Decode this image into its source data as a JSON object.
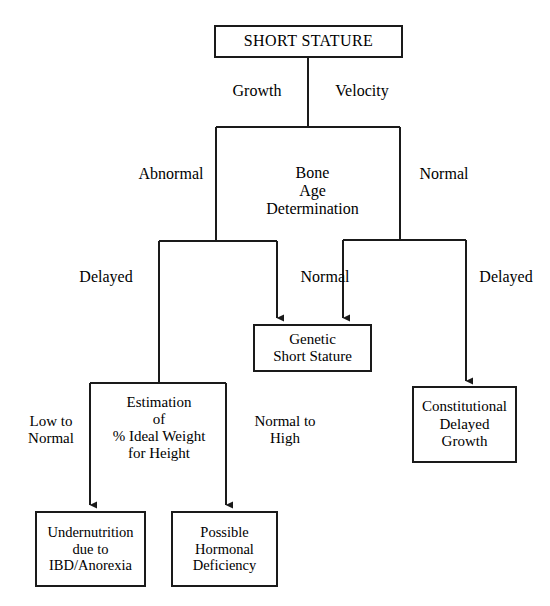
{
  "diagram": {
    "stroke_color": "#1a1a1a",
    "background_color": "#ffffff",
    "text_color": "#000000"
  },
  "nodes": {
    "short_stature": "SHORT STATURE",
    "genetic_short_stature": "Genetic\nShort Stature",
    "constitutional_delayed_growth": "Constitutional\nDelayed\nGrowth",
    "undernutrition": "Undernutrition\ndue to\nIBD/Anorexia",
    "possible_hormonal_deficiency": "Possible\nHormonal\nDeficiency"
  },
  "labels": {
    "growth": "Growth",
    "velocity": "Velocity",
    "bone_age_determination": "Bone\nAge\nDetermination",
    "abnormal": "Abnormal",
    "normal_right": "Normal",
    "delayed_left": "Delayed",
    "normal_mid": "Normal",
    "delayed_right": "Delayed",
    "estimation": "Estimation\nof\n% Ideal Weight\nfor Height",
    "low_to_normal": "Low to\nNormal",
    "normal_to_high": "Normal to\nHigh"
  }
}
